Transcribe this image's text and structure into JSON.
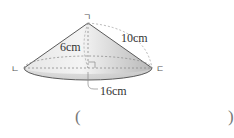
{
  "figure": {
    "shape": "cone",
    "vertices": {
      "top": "ㄱ",
      "left": "ㄴ",
      "right": "ㄷ"
    },
    "measurements": {
      "height": "6cm",
      "slant": "10cm",
      "diameter": "16cm"
    },
    "colors": {
      "outline": "#5a5a5a",
      "fill_light": "#f2f2f2",
      "fill_dark": "#bdbdbd",
      "dashed": "#8a8a8a"
    }
  },
  "answer": {
    "open": "(",
    "close": ")",
    "value": ""
  }
}
